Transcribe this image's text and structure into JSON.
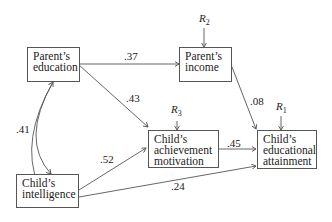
{
  "nodes": {
    "parent_education": {
      "line1": "Parent’s",
      "line2": "education"
    },
    "parent_income": {
      "line1": "Parent’s",
      "line2": "income"
    },
    "child_intelligence": {
      "line1": "Child’s",
      "line2": "intelligence"
    },
    "child_motivation": {
      "line1": "Child’s",
      "line2": "achievement",
      "line3": "motivation"
    },
    "child_attainment": {
      "line1": "Child’s",
      "line2": "educational",
      "line3": "attainment"
    }
  },
  "residuals": {
    "r2": {
      "letter": "R",
      "sub": "2"
    },
    "r3": {
      "letter": "R",
      "sub": "3"
    },
    "r1": {
      "letter": "R",
      "sub": "1"
    }
  },
  "paths": {
    "edu_to_income": ".37",
    "edu_to_motivation": ".43",
    "edu_intel_corr": ".41",
    "intel_to_motivation": ".52",
    "motivation_to_attainment": ".45",
    "income_to_attainment": ".08",
    "intel_to_attainment": ".24"
  }
}
